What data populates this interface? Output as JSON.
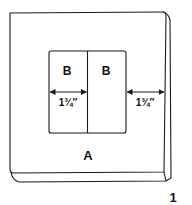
{
  "figure": {
    "number": "1",
    "line_color": "#1a1a1a",
    "background": "#ffffff"
  },
  "panel": {
    "label": "A"
  },
  "inner_pieces": [
    {
      "label": "B"
    },
    {
      "label": "B"
    }
  ],
  "dimensions": [
    {
      "label": "1¾″",
      "description": "width of inner piece B"
    },
    {
      "label": "1¾″",
      "description": "margin from inner square to panel edge"
    }
  ]
}
